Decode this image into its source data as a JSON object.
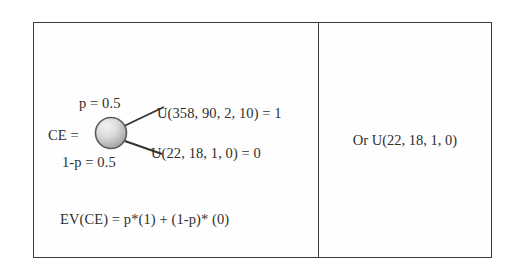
{
  "figure": {
    "type": "decision-tree-table",
    "left_cell": {
      "node_label": "CE =",
      "node_shape": "chance-node-circle",
      "branches": [
        {
          "probability_label": "p = 0.5",
          "outcome_label": "U(358, 90, 2, 10) = 1",
          "position": "top"
        },
        {
          "probability_label": "1-p = 0.5",
          "outcome_label": "U(22, 18, 1, 0) = 0",
          "position": "bottom"
        }
      ],
      "formula": "EV(CE) = p*(1) + (1-p)* (0)"
    },
    "right_cell": {
      "text": "Or U(22, 18, 1, 0)"
    },
    "colors": {
      "border": "#3a3a3a",
      "text": "#2e2e2e",
      "node_fill_light": "#e8e8e8",
      "node_fill_dark": "#9a9a9a",
      "node_stroke": "#555555",
      "branch_line": "#333333"
    }
  }
}
